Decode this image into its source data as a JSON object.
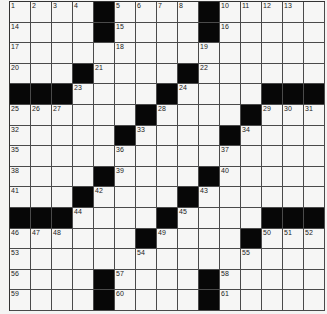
{
  "puzzle": {
    "rows": 15,
    "cols": 15,
    "layout": [
      "1234#5678#10111213",
      "placeholder"
    ],
    "grid": [
      [
        1,
        2,
        3,
        4,
        "#",
        5,
        6,
        7,
        8,
        "#",
        10,
        11,
        12,
        13,
        0
      ],
      [
        14,
        0,
        0,
        0,
        "#",
        15,
        0,
        0,
        0,
        "#",
        16,
        0,
        0,
        0,
        0
      ],
      [
        17,
        0,
        0,
        0,
        0,
        18,
        0,
        0,
        0,
        19,
        0,
        0,
        0,
        0,
        0
      ],
      [
        20,
        0,
        0,
        "#",
        21,
        0,
        0,
        0,
        "#",
        22,
        0,
        0,
        0,
        0,
        0
      ],
      [
        "#",
        "#",
        "#",
        23,
        0,
        0,
        0,
        "#",
        24,
        0,
        0,
        0,
        "#",
        "#",
        "#"
      ],
      [
        25,
        26,
        27,
        0,
        0,
        0,
        "#",
        28,
        0,
        0,
        0,
        "#",
        29,
        30,
        31
      ],
      [
        32,
        0,
        0,
        0,
        0,
        "#",
        33,
        0,
        0,
        0,
        "#",
        34,
        0,
        0,
        0
      ],
      [
        35,
        0,
        0,
        0,
        0,
        36,
        0,
        0,
        0,
        0,
        37,
        0,
        0,
        0,
        0
      ],
      [
        38,
        0,
        0,
        0,
        "#",
        39,
        0,
        0,
        0,
        "#",
        40,
        0,
        0,
        0,
        0
      ],
      [
        41,
        0,
        0,
        "#",
        42,
        0,
        0,
        0,
        "#",
        43,
        0,
        0,
        0,
        0,
        0
      ],
      [
        "#",
        "#",
        "#",
        44,
        0,
        0,
        0,
        "#",
        45,
        0,
        0,
        0,
        "#",
        "#",
        "#"
      ],
      [
        46,
        47,
        48,
        0,
        0,
        0,
        "#",
        49,
        0,
        0,
        0,
        "#",
        50,
        51,
        52
      ],
      [
        53,
        0,
        0,
        0,
        0,
        0,
        54,
        0,
        0,
        0,
        0,
        55,
        0,
        0,
        0
      ],
      [
        56,
        0,
        0,
        0,
        "#",
        57,
        0,
        0,
        0,
        "#",
        58,
        0,
        0,
        0,
        0
      ],
      [
        59,
        0,
        0,
        0,
        "#",
        60,
        0,
        0,
        0,
        "#",
        61,
        0,
        0,
        0,
        0
      ]
    ]
  }
}
